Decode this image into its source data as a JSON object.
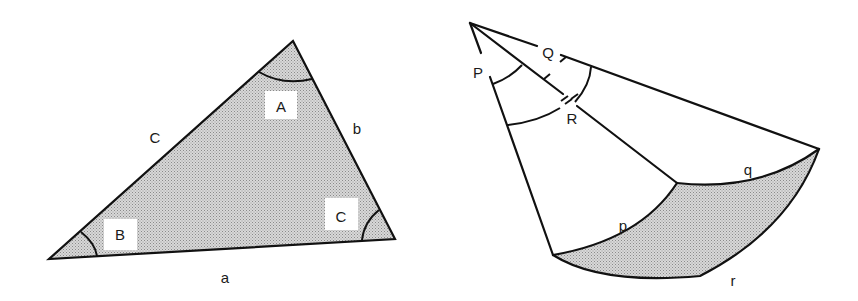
{
  "figure": {
    "left": {
      "title": "Plane triangle",
      "side_labels": {
        "a": "a",
        "b": "b",
        "c": "C"
      },
      "angle_labels": {
        "A": "A",
        "B": "B",
        "C": "C"
      },
      "fill_color": "#c9c9c9"
    },
    "right": {
      "title": "Spherical triangle on sphere sector",
      "angle_labels": {
        "P": "P",
        "Q": "Q",
        "R": "R"
      },
      "arc_labels": {
        "p": "p",
        "q": "q",
        "r": "r"
      },
      "fill_color": "#c9c9c9"
    },
    "stroke_color": "#111111",
    "background": "#ffffff"
  }
}
